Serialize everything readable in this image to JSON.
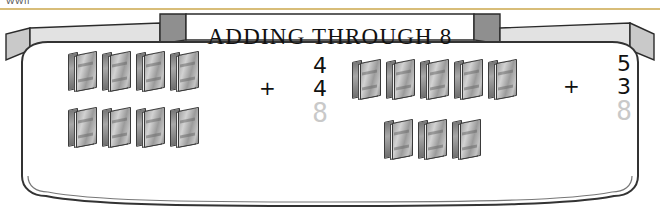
{
  "page": {
    "cropped_header_text": "WWII",
    "banner_title": "ADDING THROUGH 8"
  },
  "problems": [
    {
      "id": "left",
      "addend1": "4",
      "operator": "+",
      "addend2": "4",
      "answer_faint": "8",
      "books_row1_count": 4,
      "books_row2_count": 4,
      "book_icon": "book-icon"
    },
    {
      "id": "right",
      "addend1": "5",
      "operator": "+",
      "addend2": "3",
      "answer_faint": "8",
      "books_row1_count": 5,
      "books_row2_count": 3,
      "book_icon": "book-icon"
    }
  ],
  "colors": {
    "banner_fill": "#d9d9d9",
    "banner_stroke": "#2b2b2b",
    "frame_stroke": "#333333",
    "answer_faint": "#c9c9c9",
    "rule_gold": "#b8860b"
  }
}
